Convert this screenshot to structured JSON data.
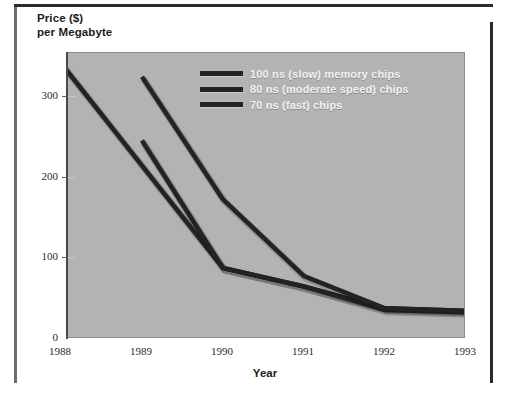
{
  "chart_data": {
    "type": "line",
    "title": "",
    "xlabel": "Year",
    "ylabel": "Price ($)\nper Megabyte",
    "ylabel_line1": "Price ($)",
    "ylabel_line2": "per Megabyte",
    "x": [
      1988,
      1989,
      1990,
      1991,
      1992,
      1993
    ],
    "xtick_labels": [
      "1988",
      "1989",
      "1990",
      "1991",
      "1992",
      "1993"
    ],
    "ytick_labels": [
      "0",
      "100",
      "200",
      "300"
    ],
    "ytick_values": [
      0,
      100,
      200,
      300
    ],
    "ylim": [
      0,
      355
    ],
    "xlim": [
      1988,
      1993
    ],
    "grid": false,
    "legend_position": "top-right-inside",
    "series": [
      {
        "name": "100 ns (slow) memory chips",
        "color": "#232323",
        "x": [
          1988,
          1989,
          1990,
          1991,
          1992,
          1993
        ],
        "values": [
          342,
          215,
          88,
          65,
          38,
          35
        ]
      },
      {
        "name": "80 ns (moderate speed) chips",
        "color": "#232323",
        "x": [
          1989,
          1990,
          1991,
          1992,
          1993
        ],
        "values": [
          246,
          88,
          65,
          36,
          33
        ]
      },
      {
        "name": "70 ns (fast) chips",
        "color": "#232323",
        "x": [
          1989,
          1990,
          1991,
          1992,
          1993
        ],
        "values": [
          325,
          173,
          78,
          38,
          35
        ]
      }
    ],
    "legend": [
      {
        "label": "100 ns (slow) memory chips",
        "color": "#232323"
      },
      {
        "label": "80 ns (moderate speed) chips",
        "color": "#232323"
      },
      {
        "label": "70 ns (fast) chips",
        "color": "#232323"
      }
    ],
    "plot_background": "#b3b3b3",
    "page_background": "#ffffff"
  }
}
